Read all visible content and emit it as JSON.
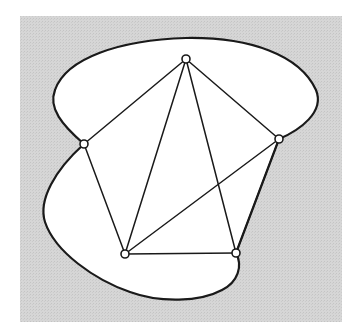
{
  "diagram": {
    "type": "graph-embedding",
    "background": {
      "x": 20,
      "y": 16,
      "width": 322,
      "height": 306,
      "fill": "#d4d4d4"
    },
    "region": {
      "fill": "#ffffff",
      "stroke": "#1a1a1a",
      "stroke_width": 2.2
    },
    "edge_style": {
      "stroke": "#1a1a1a",
      "stroke_width": 1.5
    },
    "vertex_style": {
      "radius": 4,
      "fill": "#ffffff",
      "stroke": "#1a1a1a",
      "stroke_width": 1.6
    },
    "vertices": [
      {
        "id": "A",
        "label": "top",
        "x": 186,
        "y": 59
      },
      {
        "id": "B",
        "label": "left",
        "x": 84,
        "y": 144
      },
      {
        "id": "C",
        "label": "right",
        "x": 279,
        "y": 139
      },
      {
        "id": "D",
        "label": "bottom-left",
        "x": 125,
        "y": 254
      },
      {
        "id": "E",
        "label": "bottom-right",
        "x": 236,
        "y": 253
      }
    ],
    "edges": [
      {
        "from": "A",
        "to": "B"
      },
      {
        "from": "A",
        "to": "C"
      },
      {
        "from": "A",
        "to": "D"
      },
      {
        "from": "A",
        "to": "E"
      },
      {
        "from": "B",
        "to": "D"
      },
      {
        "from": "C",
        "to": "D"
      },
      {
        "from": "C",
        "to": "E"
      },
      {
        "from": "D",
        "to": "E"
      }
    ]
  }
}
